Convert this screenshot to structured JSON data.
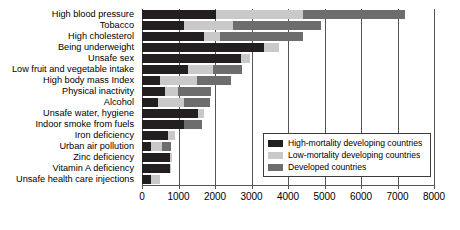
{
  "chart_data": {
    "type": "bar",
    "orientation": "horizontal",
    "stacked": true,
    "title": "",
    "subtitle": "",
    "xlabel": "",
    "ylabel": "",
    "xlim": [
      0,
      8000
    ],
    "xticks": [
      0,
      1000,
      2000,
      3000,
      4000,
      5000,
      6000,
      7000,
      8000
    ],
    "xtick_labels": [
      "0",
      "1000",
      "2000",
      "3000",
      "4000",
      "5000",
      "6000",
      "7000",
      "8000"
    ],
    "grid": true,
    "grid_axis": "x",
    "legend_position": "lower-right-inside",
    "categories": [
      "High blood pressure",
      "Tobacco",
      "High cholesterol",
      "Being underweight",
      "Unsafe sex",
      "Low fruit and vegetable intake",
      "High body mass Index",
      "Physical inactivity",
      "Alcohol",
      "Unsafe water, hygiene",
      "Indoor smoke from fuels",
      "Iron deficiency",
      "Urban air pollution",
      "Zinc deficiency",
      "Vitamin A deficiency",
      "Unsafe health care injections"
    ],
    "series": [
      {
        "name": "High-mortality developing countries",
        "color": "#231f20",
        "values": [
          2030,
          1150,
          1700,
          3340,
          2700,
          1250,
          500,
          640,
          450,
          1540,
          1140,
          700,
          250,
          780,
          760,
          250
        ]
      },
      {
        "name": "Low-mortality developing countries",
        "color": "#c9c9c9",
        "values": [
          2370,
          1340,
          450,
          400,
          250,
          700,
          1000,
          350,
          700,
          160,
          0,
          200,
          300,
          50,
          30,
          250
        ]
      },
      {
        "name": "Developed countries",
        "color": "#6d6d6d",
        "values": [
          2800,
          2410,
          2250,
          0,
          0,
          800,
          950,
          910,
          700,
          0,
          510,
          0,
          250,
          0,
          0,
          0
        ]
      }
    ],
    "totals": [
      7200,
      4900,
      4400,
      3740,
      2950,
      2750,
      2450,
      1900,
      1850,
      1700,
      1650,
      900,
      800,
      830,
      790,
      500
    ]
  },
  "legend": {
    "items": [
      {
        "label": "High-mortality developing countries",
        "color": "#231f20"
      },
      {
        "label": "Low-mortality developing countries",
        "color": "#c9c9c9"
      },
      {
        "label": "Developed countries",
        "color": "#6d6d6d"
      }
    ]
  }
}
